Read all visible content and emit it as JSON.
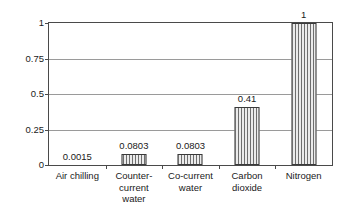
{
  "chart_data": {
    "type": "bar",
    "title": "",
    "xlabel": "",
    "ylabel": "Comparative cost",
    "ylim": [
      0,
      1
    ],
    "grid": true,
    "legend": false,
    "categories": [
      "Air chilling",
      "Counter-\ncurrent\nwater",
      "Co-current\nwater",
      "Carbon\ndioxide",
      "Nitrogen"
    ],
    "category_lines": [
      [
        "Air chilling"
      ],
      [
        "Counter-",
        "current",
        "water"
      ],
      [
        "Co-current",
        "water"
      ],
      [
        "Carbon",
        "dioxide"
      ],
      [
        "Nitrogen"
      ]
    ],
    "values": [
      0.0015,
      0.0803,
      0.0803,
      0.41,
      1
    ],
    "value_labels": [
      "0.0015",
      "0.0803",
      "0.0803",
      "0.41",
      "1"
    ],
    "yticks": [
      0,
      0.25,
      0.5,
      0.75,
      1
    ],
    "ytick_labels": [
      "0",
      "0.25",
      "0.5",
      "0.75",
      "1"
    ],
    "bar_fill": "vertical-hatch",
    "bar_edge_color": "#3a3a3a",
    "axis_color": "#4a4a4a",
    "grid_color": "#9a9a9a",
    "background": "#ffffff"
  }
}
